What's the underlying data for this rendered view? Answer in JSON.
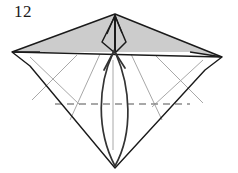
{
  "figure": {
    "kind": "origami-folding-diagram",
    "step_number": "12",
    "title": "Origami step 12 — diamond base with petal fold and valley fold",
    "background_color": "#ffffff"
  },
  "colors": {
    "paper_fill": "#ffffff",
    "shaded_fill": "#cccccc",
    "outline_stroke": "#1a1a1a",
    "crease_stroke": "#a8a8a8",
    "dashed_stroke": "#8c8c8c",
    "arrow_stroke": "#333333",
    "label_color": "#1a1a1a"
  },
  "geometry": {
    "apex_top": [
      115,
      14
    ],
    "vertex_left": [
      12,
      52
    ],
    "vertex_right": [
      222,
      57
    ],
    "vertex_bottom": [
      115,
      168
    ],
    "shaded_band_base_y": 52,
    "dashed_line": {
      "x1": 55,
      "x2": 190,
      "y": 104
    }
  },
  "annotations": {
    "shaded_region_label": "shaded-upper-band",
    "center_kite_label": "center-kite-flap",
    "dashed_line_label": "valley-fold-line",
    "curved_arrow_label": "fold-up-arrow",
    "crease_left_label": "left-crease-x",
    "crease_right_label": "right-crease-x"
  }
}
